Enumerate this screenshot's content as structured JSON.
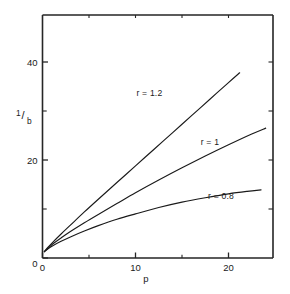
{
  "chart_data": {
    "type": "line",
    "title": "",
    "xlabel": "p",
    "ylabel": "1/b",
    "ylabel_numerator": "1",
    "ylabel_denominator": "b",
    "ylabel_slash": "/",
    "xlim": [
      0,
      25
    ],
    "ylim": [
      0,
      47
    ],
    "grid": false,
    "legend_position": "inline-annotations",
    "x_ticks_major": [
      0,
      10,
      20
    ],
    "x_ticklabels": [
      "0",
      "10",
      "20"
    ],
    "x_ticks_minor": [
      5,
      15
    ],
    "y_ticks_major": [
      0,
      20,
      40
    ],
    "y_ticklabels": [
      "0",
      "20",
      "40"
    ],
    "y_ticks_minor": [
      10,
      30
    ],
    "series": [
      {
        "name": "r = 1.2",
        "label": "r = 1.2",
        "r": 1.2,
        "color": "#1a1a1a",
        "label_x": 11.5,
        "label_y": 33.0,
        "x": [
          0.2,
          0.6,
          1.2,
          2.0,
          3.0,
          4.5,
          6.0,
          8.0,
          10.0,
          12.0,
          14.0,
          16.0,
          18.0,
          20.0,
          21.2
        ],
        "y": [
          1.3,
          2.2,
          3.4,
          4.9,
          6.7,
          9.4,
          12.0,
          15.4,
          18.8,
          22.2,
          25.6,
          29.0,
          32.4,
          35.8,
          37.8
        ]
      },
      {
        "name": "r = 1",
        "label": "r = 1",
        "r": 1.0,
        "color": "#1a1a1a",
        "label_x": 18.0,
        "label_y": 23.0,
        "x": [
          0.2,
          0.6,
          1.2,
          2.0,
          3.0,
          4.5,
          6.0,
          8.0,
          10.0,
          12.5,
          15.0,
          17.5,
          20.0,
          22.5,
          24.0
        ],
        "y": [
          1.3,
          2.0,
          3.0,
          4.1,
          5.4,
          7.2,
          8.9,
          11.1,
          13.3,
          15.9,
          18.4,
          20.8,
          23.1,
          25.3,
          26.5
        ]
      },
      {
        "name": "r = 0.8",
        "label": "r = 0.8",
        "r": 0.8,
        "color": "#1a1a1a",
        "label_x": 19.2,
        "label_y": 12.0,
        "x": [
          0.2,
          0.6,
          1.2,
          2.0,
          3.0,
          4.5,
          6.0,
          8.0,
          10.0,
          12.5,
          15.0,
          17.5,
          20.0,
          22.0,
          23.5
        ],
        "y": [
          1.3,
          1.9,
          2.6,
          3.4,
          4.3,
          5.5,
          6.6,
          7.9,
          9.0,
          10.3,
          11.4,
          12.3,
          13.1,
          13.6,
          13.9
        ]
      }
    ]
  }
}
